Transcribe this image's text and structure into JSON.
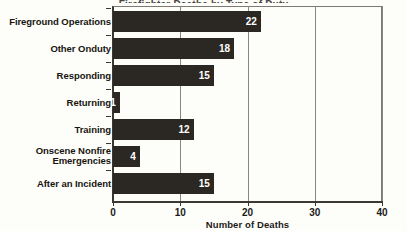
{
  "chart_data": {
    "type": "bar",
    "orientation": "horizontal",
    "title": "",
    "xlabel": "Number of Deaths",
    "ylabel": "",
    "xlim": [
      0,
      40
    ],
    "xticks": [
      0,
      10,
      20,
      30,
      40
    ],
    "grid": true,
    "legend": false,
    "categories": [
      "Fireground Operations",
      "Other Onduty",
      "Responding",
      "Returning",
      "Training",
      "Onscene Nonfire Emergencies",
      "After an Incident"
    ],
    "values": [
      22,
      18,
      15,
      1,
      12,
      4,
      15
    ],
    "bar_color": "#2b2723",
    "value_label_color": "#ffffff",
    "background": "#fdfdfa"
  },
  "axis": {
    "tick_labels": [
      "0",
      "10",
      "20",
      "30",
      "40"
    ],
    "x_title": "Number of Deaths"
  },
  "title_remnant": "Firefighter Deaths by Type of Duty"
}
